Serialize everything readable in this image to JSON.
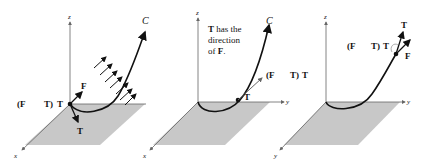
{
  "panels": [
    {
      "id": "left",
      "axes": {
        "x": "x",
        "y": "y",
        "z": "z"
      },
      "curve_label": "C",
      "labels": {
        "projection_open": "(F",
        "projection_close": "T)",
        "projection_T": "T",
        "F": "F",
        "T": "T"
      }
    },
    {
      "id": "middle",
      "axes": {
        "x": "x",
        "y": "y",
        "z": "z"
      },
      "curve_label": "C",
      "caption": [
        "T has the",
        "direction",
        "of F."
      ],
      "labels": {
        "projection_open": "(F",
        "projection_close": "T)",
        "projection_T": "T",
        "T": "T"
      }
    },
    {
      "id": "right",
      "axes": {
        "x": "x",
        "y": "y",
        "z": "z"
      },
      "labels": {
        "projection_open": "(F",
        "projection_close": "T)",
        "projection_T": "T",
        "T": "T",
        "F": "F"
      }
    }
  ],
  "colors": {
    "plane": "#c8c8c8",
    "curve": "#111111",
    "axis": "#555555"
  }
}
